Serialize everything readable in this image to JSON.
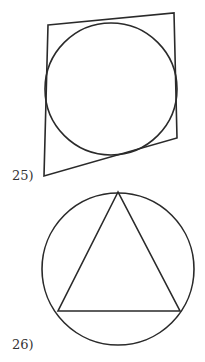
{
  "figures": [
    {
      "label": "25)",
      "shape": "quadrilateral circumscribed about a circle",
      "quadrilateral": [
        [
          48,
          25
        ],
        [
          174,
          13
        ],
        [
          177,
          138
        ],
        [
          44,
          176
        ]
      ],
      "circle": {
        "cx": 111,
        "cy": 89,
        "r": 66
      }
    },
    {
      "label": "26)",
      "shape": "equilateral triangle inscribed in a circle",
      "triangle": [
        [
          118,
          192
        ],
        [
          58,
          311
        ],
        [
          180,
          311
        ]
      ],
      "circle": {
        "cx": 118,
        "cy": 269,
        "r": 76
      }
    }
  ],
  "colors": {
    "stroke": "#2a2a2a",
    "text": "#333333",
    "background": "#ffffff"
  }
}
